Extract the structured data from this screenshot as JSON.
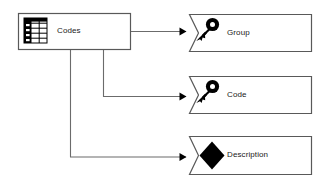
{
  "diagram": {
    "type": "entity-attribute-diagram",
    "background_color": "#ffffff",
    "line_color": "#6b6b6b",
    "shape_stroke_color": "#595959",
    "text_color": "#1a1a1a",
    "icon_color": "#000000",
    "entity": {
      "label": "Codes",
      "icon": "table-icon",
      "shape": "rectangle",
      "x": 18,
      "y": 13,
      "width": 113,
      "height": 37
    },
    "attributes": [
      {
        "label": "Group",
        "icon": "key-icon",
        "shape": "notched-rectangle",
        "x": 189,
        "y": 14,
        "width": 123,
        "height": 38
      },
      {
        "label": "Code",
        "icon": "key-icon",
        "shape": "notched-rectangle",
        "x": 189,
        "y": 76,
        "width": 123,
        "height": 38
      },
      {
        "label": "Description",
        "icon": "diamond-icon",
        "shape": "notched-rectangle",
        "x": 189,
        "y": 136,
        "width": 123,
        "height": 39
      }
    ],
    "connectors": [
      {
        "from": "Codes",
        "to": "Group",
        "arrowhead": "filled-triangle",
        "route": "right-edge-straight"
      },
      {
        "from": "Codes",
        "to": "Code",
        "arrowhead": "filled-triangle",
        "route": "bottom-elbow-mid"
      },
      {
        "from": "Codes",
        "to": "Description",
        "arrowhead": "filled-triangle",
        "route": "bottom-elbow-left"
      }
    ]
  }
}
